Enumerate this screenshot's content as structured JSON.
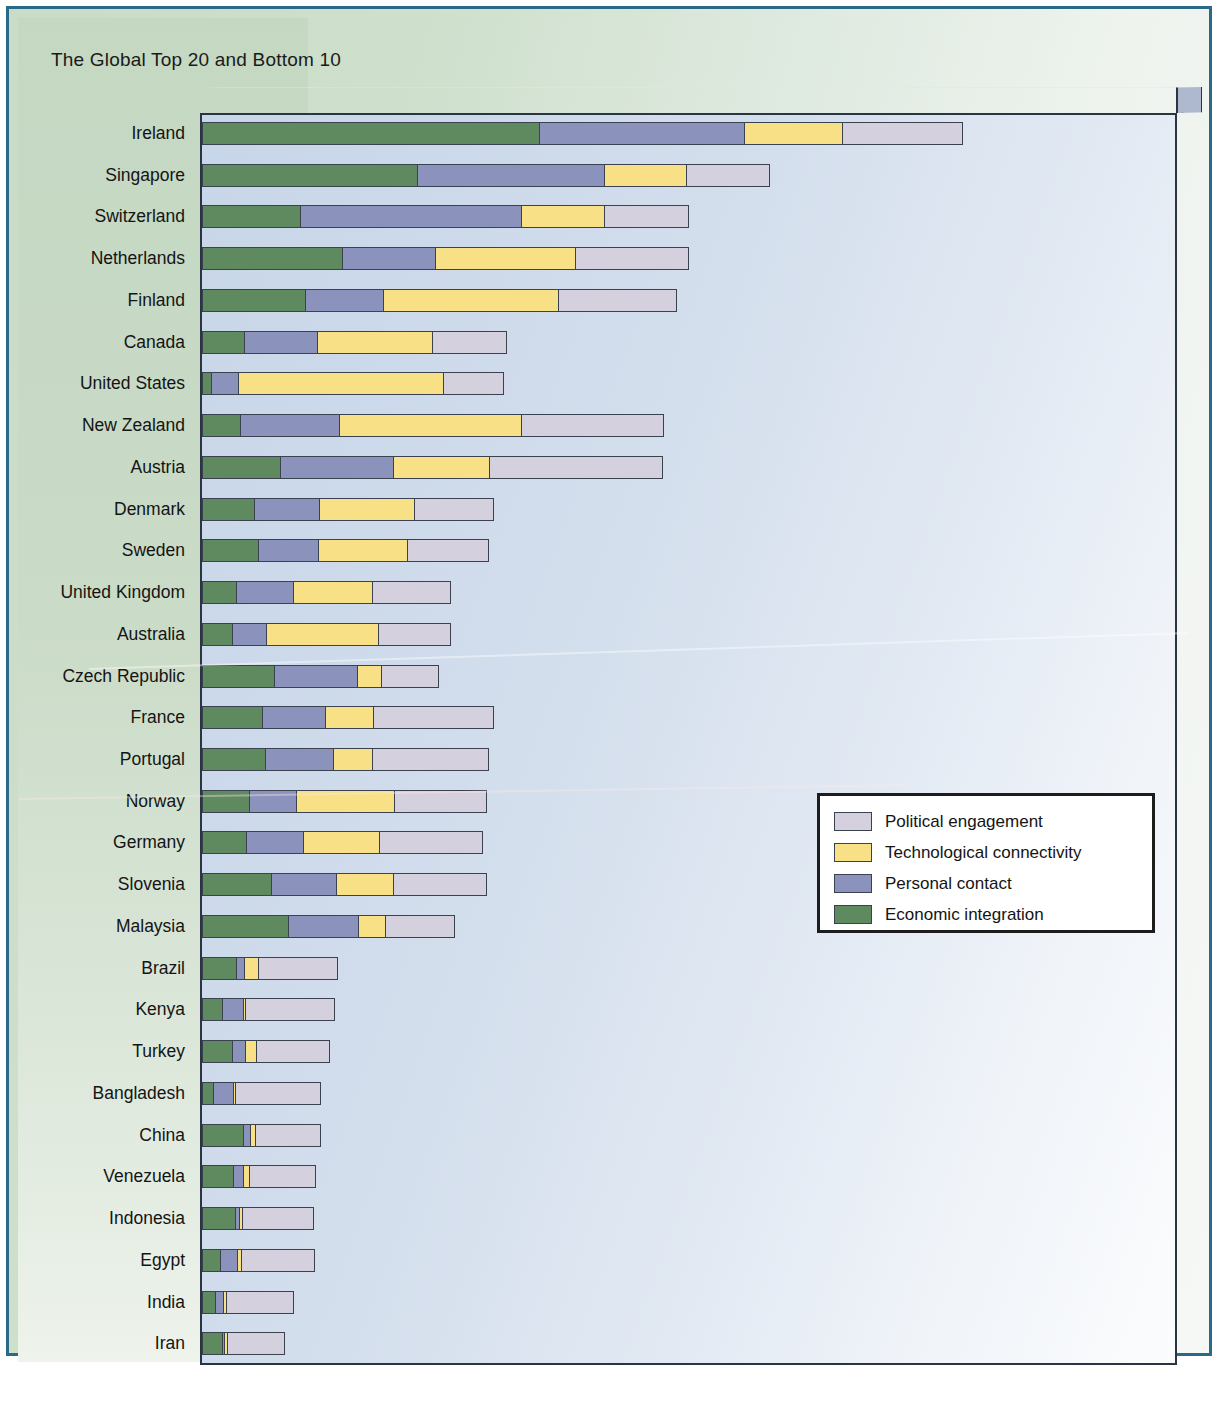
{
  "title": "The Global Top 20 and Bottom 10",
  "legend": {
    "items": [
      {
        "label": "Political engagement",
        "color": "#d5d0de"
      },
      {
        "label": "Technological connectivity",
        "color": "#f7e086"
      },
      {
        "label": "Personal contact",
        "color": "#8b93bd"
      },
      {
        "label": "Economic integration",
        "color": "#5f8a5f"
      }
    ]
  },
  "chart_data": {
    "type": "bar",
    "orientation": "horizontal",
    "stacked": true,
    "title": "The Global Top 20 and Bottom 10",
    "xlabel": "",
    "ylabel": "",
    "grid": false,
    "legend_position": "center-right",
    "axis_note": "No numeric axis ticks shown; values are segment lengths in index points read off the bar pixels.",
    "series": [
      {
        "name": "Economic integration",
        "color": "#5f8a5f",
        "values": [
          34.5,
          22.0,
          10.0,
          14.3,
          10.5,
          4.3,
          0.8,
          3.8,
          8.0,
          5.3,
          6.1,
          3.5,
          3.1,
          7.6,
          6.5,
          6.9,
          4.9,
          4.6,
          7.4,
          9.4,
          3.6,
          2.1,
          3.1,
          1.1,
          4.5,
          3.4,
          3.6,
          1.9,
          1.3,
          2.1
        ]
      },
      {
        "name": "Personal contact",
        "color": "#8b93bd",
        "values": [
          21.5,
          19.0,
          23.3,
          9.7,
          8.3,
          7.6,
          2.8,
          10.5,
          11.8,
          6.8,
          6.3,
          6.0,
          3.6,
          8.6,
          6.5,
          6.9,
          5.0,
          6.0,
          6.9,
          7.4,
          0.9,
          2.3,
          1.5,
          2.2,
          0.7,
          1.0,
          0.4,
          1.9,
          0.8,
          0.3
        ]
      },
      {
        "name": "Technological connectivity",
        "color": "#f7e086",
        "values": [
          10.0,
          8.6,
          8.6,
          14.4,
          17.9,
          11.8,
          21.5,
          18.6,
          9.9,
          9.9,
          9.2,
          8.1,
          11.8,
          2.5,
          4.9,
          3.9,
          10.2,
          7.9,
          5.9,
          2.8,
          1.4,
          0.2,
          1.1,
          0.2,
          0.5,
          0.6,
          0.3,
          0.4,
          0.3,
          0.3
        ]
      },
      {
        "name": "Political engagement",
        "color": "#d5d0de",
        "values": [
          34.0,
          8.6,
          8.6,
          11.8,
          12.4,
          7.8,
          6.1,
          14.9,
          18.2,
          8.1,
          8.3,
          7.9,
          7.5,
          5.9,
          12.2,
          11.7,
          9.7,
          10.4,
          9.8,
          7.4,
          8.0,
          9.0,
          7.7,
          8.6,
          6.6,
          6.7,
          7.2,
          7.4,
          6.9,
          6.0
        ]
      }
    ],
    "categories": [
      "Ireland",
      "Singapore",
      "Switzerland",
      "Netherlands",
      "Finland",
      "Canada",
      "United States",
      "New Zealand",
      "Austria",
      "Denmark",
      "Sweden",
      "United Kingdom",
      "Australia",
      "Czech Republic",
      "France",
      "Portugal",
      "Norway",
      "Germany",
      "Slovenia",
      "Malaysia",
      "Brazil",
      "Kenya",
      "Turkey",
      "Bangladesh",
      "China",
      "Venezuela",
      "Indonesia",
      "Egypt",
      "India",
      "Iran"
    ],
    "totals": [
      100.0,
      58.2,
      50.5,
      50.2,
      49.1,
      31.5,
      31.2,
      47.8,
      47.9,
      30.1,
      29.9,
      25.5,
      26.0,
      24.6,
      30.1,
      29.4,
      29.8,
      28.9,
      30.0,
      27.0,
      13.9,
      13.6,
      13.4,
      12.1,
      12.3,
      11.7,
      11.5,
      11.6,
      9.3,
      8.7
    ]
  },
  "bars": [
    {
      "country": "Ireland",
      "segments": [
        337,
        205,
        99,
        120
      ],
      "total": 761
    },
    {
      "country": "Singapore",
      "segments": [
        215,
        187,
        83,
        83
      ],
      "total": 568
    },
    {
      "country": "Switzerland",
      "segments": [
        97,
        222,
        84,
        84
      ],
      "total": 487
    },
    {
      "country": "Netherlands",
      "segments": [
        140,
        93,
        141,
        113
      ],
      "total": 487
    },
    {
      "country": "Finland",
      "segments": [
        102,
        79,
        175,
        119
      ],
      "total": 475
    },
    {
      "country": "Canada",
      "segments": [
        41,
        74,
        115,
        75
      ],
      "total": 305
    },
    {
      "country": "United States",
      "segments": [
        8,
        27,
        207,
        60
      ],
      "total": 302
    },
    {
      "country": "New Zealand",
      "segments": [
        37,
        100,
        182,
        143
      ],
      "total": 462
    },
    {
      "country": "Austria",
      "segments": [
        77,
        114,
        96,
        174
      ],
      "total": 461
    },
    {
      "country": "Denmark",
      "segments": [
        51,
        66,
        95,
        80
      ],
      "total": 292
    },
    {
      "country": "Sweden",
      "segments": [
        55,
        61,
        89,
        82
      ],
      "total": 287
    },
    {
      "country": "United Kingdom",
      "segments": [
        33,
        58,
        79,
        79
      ],
      "total": 249
    },
    {
      "country": "Australia",
      "segments": [
        29,
        34,
        113,
        73
      ],
      "total": 249
    },
    {
      "country": "Czech Republic",
      "segments": [
        72,
        83,
        25,
        57
      ],
      "total": 237
    },
    {
      "country": "France",
      "segments": [
        59,
        64,
        48,
        121
      ],
      "total": 292
    },
    {
      "country": "Portugal",
      "segments": [
        62,
        69,
        39,
        117
      ],
      "total": 287
    },
    {
      "country": "Norway",
      "segments": [
        46,
        48,
        98,
        93
      ],
      "total": 285
    },
    {
      "country": "Germany",
      "segments": [
        43,
        58,
        76,
        104
      ],
      "total": 281
    },
    {
      "country": "Slovenia",
      "segments": [
        68,
        66,
        57,
        94
      ],
      "total": 285
    },
    {
      "country": "Malaysia",
      "segments": [
        86,
        70,
        27,
        70
      ],
      "total": 253
    },
    {
      "country": "Brazil",
      "segments": [
        34,
        8,
        14,
        80
      ],
      "total": 136
    },
    {
      "country": "Kenya",
      "segments": [
        19,
        22,
        2,
        90
      ],
      "total": 133
    },
    {
      "country": "Turkey",
      "segments": [
        29,
        14,
        11,
        74
      ],
      "total": 128
    },
    {
      "country": "Bangladesh",
      "segments": [
        10,
        21,
        2,
        86
      ],
      "total": 119
    },
    {
      "country": "China",
      "segments": [
        41,
        7,
        5,
        66
      ],
      "total": 119
    },
    {
      "country": "Venezuela",
      "segments": [
        31,
        10,
        6,
        67
      ],
      "total": 114
    },
    {
      "country": "Indonesia",
      "segments": [
        33,
        4,
        3,
        72
      ],
      "total": 112
    },
    {
      "country": "Egypt",
      "segments": [
        17,
        18,
        4,
        74
      ],
      "total": 113
    },
    {
      "country": "India",
      "segments": [
        12,
        8,
        3,
        69
      ],
      "total": 92
    },
    {
      "country": "Iran",
      "segments": [
        19,
        3,
        3,
        58
      ],
      "total": 83
    }
  ]
}
